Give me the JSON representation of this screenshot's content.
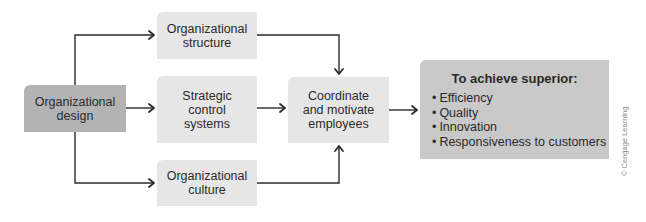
{
  "diagram": {
    "nodes": {
      "design": {
        "label_line1": "Organizational",
        "label_line2": "design"
      },
      "structure": {
        "label_line1": "Organizational",
        "label_line2": "structure"
      },
      "control": {
        "label_line1": "Strategic",
        "label_line2": "control",
        "label_line3": "systems"
      },
      "culture": {
        "label_line1": "Organizational",
        "label_line2": "culture"
      },
      "coordinate": {
        "label_line1": "Coordinate",
        "label_line2": "and motivate",
        "label_line3": "employees"
      },
      "superior": {
        "title": "To achieve superior:",
        "items": [
          "Efficiency",
          "Quality",
          "Innovation",
          "Responsiveness to customers"
        ]
      }
    },
    "edges": [
      {
        "from": "design",
        "to": "structure"
      },
      {
        "from": "design",
        "to": "control"
      },
      {
        "from": "design",
        "to": "culture"
      },
      {
        "from": "structure",
        "to": "coordinate"
      },
      {
        "from": "control",
        "to": "coordinate"
      },
      {
        "from": "culture",
        "to": "coordinate"
      },
      {
        "from": "coordinate",
        "to": "superior"
      }
    ],
    "colors": {
      "dark_box": "#b3b3b3",
      "light_box": "#e6e6e6",
      "result_box": "#c9c9c9",
      "line": "#2a2a2a"
    },
    "credit": "© Cengage Learning"
  }
}
